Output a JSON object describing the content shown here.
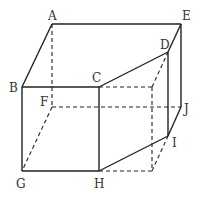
{
  "figure": {
    "type": "geometric-solid",
    "vertices": {
      "A": {
        "label": "A",
        "x": 52,
        "y": 24
      },
      "B": {
        "label": "B",
        "x": 22,
        "y": 87
      },
      "C": {
        "label": "C",
        "x": 99,
        "y": 87
      },
      "D": {
        "label": "D",
        "x": 168,
        "y": 52
      },
      "E": {
        "label": "E",
        "x": 181,
        "y": 24
      },
      "F": {
        "label": "F",
        "x": 52,
        "y": 107
      },
      "G": {
        "label": "G",
        "x": 22,
        "y": 171
      },
      "H": {
        "label": "H",
        "x": 99,
        "y": 171
      },
      "I": {
        "label": "I",
        "x": 168,
        "y": 136
      },
      "J": {
        "label": "J",
        "x": 181,
        "y": 107
      }
    },
    "labels": {
      "A": "A",
      "B": "B",
      "C": "C",
      "D": "D",
      "E": "E",
      "F": "F",
      "G": "G",
      "H": "H",
      "I": "I",
      "J": "J"
    },
    "solid_edges": [
      "A-E",
      "A-B",
      "B-C",
      "C-D",
      "D-E",
      "B-G",
      "C-H",
      "G-H",
      "H-I",
      "D-I",
      "E-J",
      "I-J"
    ],
    "dashed_edges": [
      "A-F",
      "F-G",
      "F-J",
      "C-K",
      "K-D",
      "K-L",
      "L-H",
      "L-I"
    ],
    "hidden_points": {
      "K": {
        "x": 152,
        "y": 87
      },
      "L": {
        "x": 152,
        "y": 171
      }
    }
  }
}
